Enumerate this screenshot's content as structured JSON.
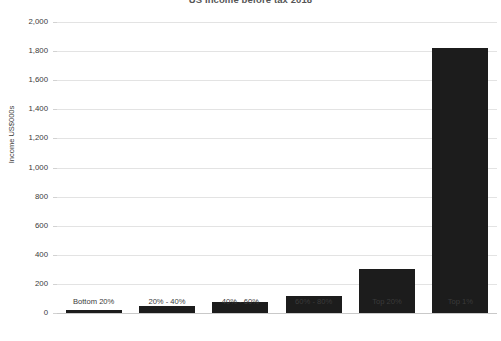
{
  "chart_data": {
    "type": "bar",
    "title": "US Income before tax 2018",
    "xlabel": "",
    "ylabel": "Income US$000s",
    "categories": [
      "Bottom 20%",
      "20% - 40%",
      "40% - 60%",
      "60% - 80%",
      "Top 20%",
      "Top 1%"
    ],
    "values": [
      20,
      45,
      75,
      115,
      300,
      1820
    ],
    "ylim": [
      0,
      2000
    ],
    "yticks": [
      0,
      200,
      400,
      600,
      800,
      1000,
      1200,
      1400,
      1600,
      1800,
      2000
    ],
    "ytick_labels": [
      "0",
      "200",
      "400",
      "600",
      "800",
      "1,000",
      "1,200",
      "1,400",
      "1,600",
      "1,800",
      "2,000"
    ],
    "grid": true,
    "legend": false,
    "bar_color": "#1c1c1c",
    "gridline_color": "#e3e3e3",
    "background_color": "#ffffff"
  }
}
